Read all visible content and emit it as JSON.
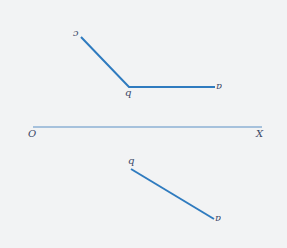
{
  "diagram": {
    "type": "orthographic-projection",
    "colors": {
      "background": "#f2f3f4",
      "line": "#2f7bbf",
      "axis": "#5a8fc4",
      "label": "#3b4866"
    },
    "axis": {
      "origin_label": "O",
      "end_label": "X",
      "x1": 33,
      "y1": 127,
      "x2": 262,
      "y2": 127
    },
    "top_view": {
      "points": [
        {
          "name": "c",
          "label": "c",
          "x": 81,
          "y": 37
        },
        {
          "name": "b",
          "label": "b",
          "x": 129,
          "y": 87
        },
        {
          "name": "a",
          "label": "a",
          "x": 215,
          "y": 87
        }
      ]
    },
    "bottom_view": {
      "points": [
        {
          "name": "b",
          "label": "b",
          "x": 131,
          "y": 169
        },
        {
          "name": "a",
          "label": "a",
          "x": 214,
          "y": 219
        }
      ]
    }
  }
}
